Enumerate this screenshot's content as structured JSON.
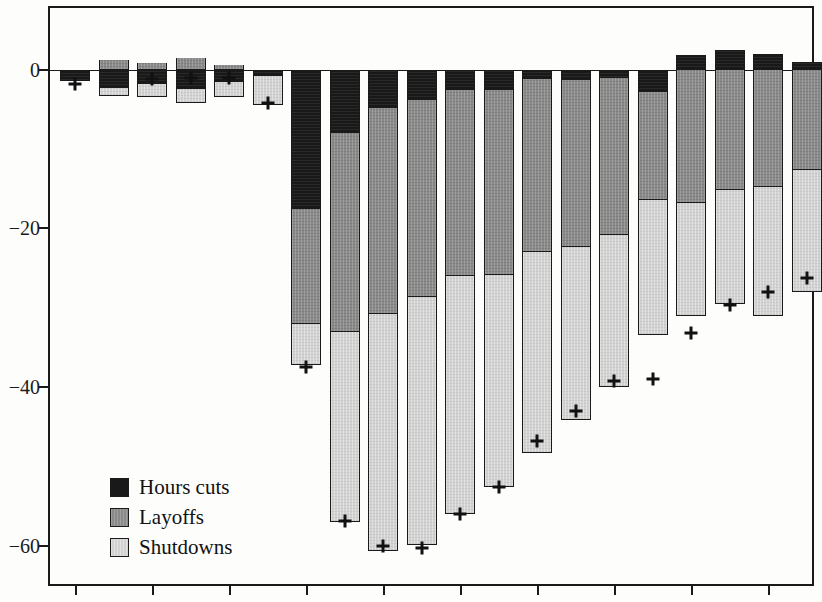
{
  "chart_data": {
    "type": "bar",
    "subtype": "stacked-bar-negative",
    "title": "",
    "subtitle": "",
    "xlabel": "",
    "ylabel": "",
    "ylim": [
      -65,
      8
    ],
    "yticks": [
      0,
      -20,
      -40,
      -60
    ],
    "ytick_labels": [
      "0",
      "−20",
      "−40",
      "−60"
    ],
    "grid": false,
    "legend_position": "bottom-left",
    "categories": [
      "1",
      "2",
      "3",
      "4",
      "5",
      "6",
      "7",
      "8",
      "9",
      "10",
      "11",
      "12",
      "13",
      "14",
      "15",
      "16",
      "17",
      "18",
      "19",
      "20"
    ],
    "xtick_labels": [
      "",
      "",
      "",
      "",
      "",
      "",
      "",
      "",
      "",
      "",
      "",
      "",
      "",
      "",
      "",
      "",
      "",
      "",
      "",
      ""
    ],
    "series": [
      {
        "name": "Hours cuts",
        "color": "#191919",
        "values": [
          -1.5,
          -2.3,
          -1.8,
          -2.4,
          -1.6,
          -0.8,
          -17.5,
          -8.0,
          -4.8,
          -3.8,
          -2.6,
          -2.6,
          -1.2,
          -1.3,
          -1.0,
          -2.8,
          1.8,
          2.4,
          2.0,
          0.9
        ]
      },
      {
        "name": "Layoffs",
        "color": "#8a8a8a",
        "values": [
          0.0,
          1.2,
          0.8,
          1.4,
          0.6,
          0.0,
          -14.5,
          -25.0,
          -26.0,
          -24.8,
          -23.4,
          -23.2,
          -21.8,
          -21.0,
          -19.8,
          -13.6,
          -16.8,
          -15.2,
          -14.8,
          -12.6
        ]
      },
      {
        "name": "Shutdowns",
        "color": "#d2d2d2",
        "values": [
          0.0,
          -1.0,
          -1.6,
          -1.8,
          -1.8,
          -3.6,
          -5.2,
          -24.0,
          -29.8,
          -31.2,
          -30.0,
          -26.8,
          -25.2,
          -21.8,
          -19.2,
          -17.0,
          -14.2,
          -14.3,
          -16.2,
          -15.4
        ]
      }
    ],
    "net_markers": {
      "name": "Net total",
      "marker": "+",
      "values": [
        -1.8,
        null,
        -1.2,
        -1.1,
        -1.0,
        -4.2,
        -37.4,
        -56.8,
        -60.0,
        -60.2,
        -56.0,
        -52.6,
        -46.8,
        -43.0,
        -39.2,
        -38.9,
        -33.2,
        -29.6,
        -28.0,
        -26.2
      ]
    },
    "legend": [
      {
        "label": "Hours cuts",
        "color": "#191919"
      },
      {
        "label": "Layoffs",
        "color": "#8a8a8a"
      },
      {
        "label": "Shutdowns",
        "color": "#d2d2d2"
      }
    ]
  }
}
